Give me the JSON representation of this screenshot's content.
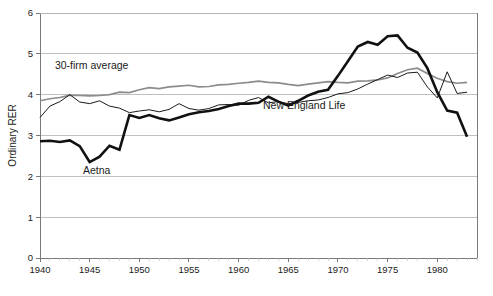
{
  "chart_data": {
    "type": "line",
    "title": "",
    "xlabel": "",
    "ylabel": "Ordinary RER",
    "xlim": [
      1940,
      1984
    ],
    "ylim": [
      0,
      6
    ],
    "grid": true,
    "legend_position": "inline-annotations",
    "y_ticks": [
      "0",
      "1",
      "2",
      "3",
      "4",
      "5",
      "6"
    ],
    "x_ticks": [
      "1940",
      "1945",
      "1950",
      "1955",
      "1960",
      "1965",
      "1970",
      "1975",
      "1980"
    ],
    "x": [
      1940,
      1941,
      1942,
      1943,
      1944,
      1945,
      1946,
      1947,
      1948,
      1949,
      1950,
      1951,
      1952,
      1953,
      1954,
      1955,
      1956,
      1957,
      1958,
      1959,
      1960,
      1961,
      1962,
      1963,
      1964,
      1965,
      1966,
      1967,
      1968,
      1969,
      1970,
      1971,
      1972,
      1973,
      1974,
      1975,
      1976,
      1977,
      1978,
      1979,
      1980,
      1981,
      1982,
      1983
    ],
    "series": [
      {
        "name": "30-firm average",
        "color": "#8c8c8c",
        "width": 1.7,
        "label_x": 1945.2,
        "label_y": 4.62,
        "values": [
          3.85,
          3.9,
          3.93,
          3.99,
          3.98,
          3.97,
          3.98,
          4.0,
          4.06,
          4.05,
          4.12,
          4.17,
          4.15,
          4.19,
          4.21,
          4.23,
          4.19,
          4.2,
          4.24,
          4.25,
          4.28,
          4.3,
          4.33,
          4.3,
          4.29,
          4.25,
          4.22,
          4.26,
          4.29,
          4.32,
          4.3,
          4.29,
          4.33,
          4.34,
          4.36,
          4.41,
          4.52,
          4.61,
          4.65,
          4.52,
          4.4,
          4.32,
          4.28,
          4.3
        ]
      },
      {
        "name": "New England Life",
        "color": "#1a1a1a",
        "width": 1.0,
        "label_x": 1966.6,
        "label_y": 3.64,
        "values": [
          3.44,
          3.72,
          3.83,
          4.0,
          3.82,
          3.78,
          3.85,
          3.72,
          3.67,
          3.56,
          3.6,
          3.63,
          3.58,
          3.64,
          3.78,
          3.66,
          3.62,
          3.66,
          3.75,
          3.76,
          3.74,
          3.86,
          3.93,
          3.8,
          3.83,
          3.78,
          3.81,
          3.85,
          3.87,
          3.93,
          4.02,
          4.05,
          4.14,
          4.26,
          4.37,
          4.48,
          4.42,
          4.53,
          4.55,
          4.19,
          3.92,
          4.56,
          4.03,
          4.06
        ]
      },
      {
        "name": "Aetna",
        "color": "#111111",
        "width": 2.6,
        "label_x": 1945.7,
        "label_y": 2.06,
        "values": [
          2.86,
          2.87,
          2.84,
          2.88,
          2.74,
          2.35,
          2.48,
          2.75,
          2.65,
          3.5,
          3.43,
          3.5,
          3.42,
          3.37,
          3.44,
          3.52,
          3.57,
          3.6,
          3.65,
          3.72,
          3.78,
          3.78,
          3.8,
          3.95,
          3.83,
          3.73,
          3.85,
          3.98,
          4.07,
          4.12,
          4.46,
          4.82,
          5.18,
          5.29,
          5.22,
          5.43,
          5.45,
          5.15,
          5.03,
          4.65,
          4.06,
          3.61,
          3.56,
          2.97
        ]
      }
    ],
    "annotations": [
      {
        "text": "30-firm average",
        "series": "30-firm average"
      },
      {
        "text": "New England Life",
        "series": "New England Life"
      },
      {
        "text": "Aetna",
        "series": "Aetna"
      }
    ]
  }
}
